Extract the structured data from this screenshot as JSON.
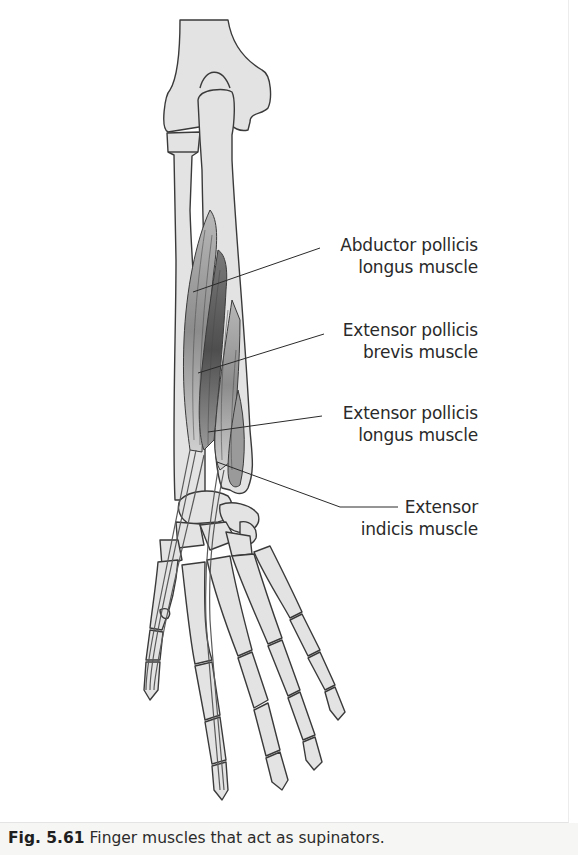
{
  "figure": {
    "labels": [
      {
        "id": "abductor-pollicis-longus",
        "line1": "Abductor pollicis",
        "line2": "longus muscle"
      },
      {
        "id": "extensor-pollicis-brevis",
        "line1": "Extensor pollicis",
        "line2": "brevis muscle"
      },
      {
        "id": "extensor-pollicis-longus",
        "line1": "Extensor pollicis",
        "line2": "longus muscle"
      },
      {
        "id": "extensor-indicis",
        "line1": "Extensor",
        "line2": "indicis muscle"
      }
    ],
    "caption": {
      "number": "Fig. 5.61",
      "text": "Finger muscles that act as supinators."
    },
    "colors": {
      "bone": "#e3e3e3",
      "outline": "#3a3a3a",
      "muscle_light": "#a8a8a8",
      "muscle_dark": "#5e5e5e",
      "caption_bg": "#f6f6f4"
    }
  }
}
